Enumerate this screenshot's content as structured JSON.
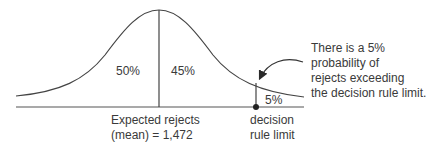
{
  "diagram": {
    "type": "normal-distribution-curve",
    "regions": [
      {
        "label": "50%"
      },
      {
        "label": "45%"
      },
      {
        "label": "5%"
      }
    ],
    "mean_label_line1": "Expected rejects",
    "mean_label_line2": "(mean) = 1,472",
    "limit_label_line1": "decision",
    "limit_label_line2": "rule limit",
    "annotation": {
      "line1": "There is a 5%",
      "line2": "probability of",
      "line3": "rejects exceeding",
      "line4": "the decision rule limit."
    },
    "colors": {
      "stroke": "#3a3a3a",
      "text": "#3a3a3a"
    }
  }
}
